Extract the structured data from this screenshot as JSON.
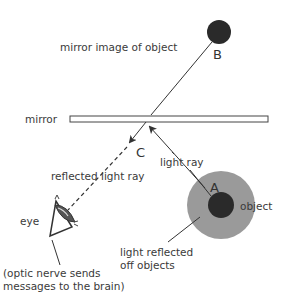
{
  "diagram": {
    "labels": {
      "mirror_image": "mirror image of object",
      "mirror": "mirror",
      "reflected_ray": "reflected light ray",
      "light_ray": "light ray",
      "object": "object",
      "eye": "eye",
      "light_reflected_1": "light reflected",
      "light_reflected_2": "off objects",
      "optic_1": "(optic nerve sends",
      "optic_2": "messages to the brain)"
    },
    "points": {
      "A": "A",
      "B": "B",
      "C": "C"
    },
    "colors": {
      "object_core": "#2a2a2a",
      "object_halo": "#9a9a9a",
      "line": "#333333",
      "mirror_fill": "#ffffff"
    }
  }
}
